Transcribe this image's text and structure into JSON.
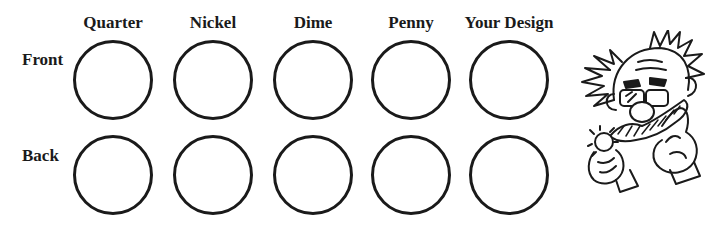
{
  "columns": [
    {
      "label": "Quarter",
      "x": 113
    },
    {
      "label": "Nickel",
      "x": 213
    },
    {
      "label": "Dime",
      "x": 313
    },
    {
      "label": "Penny",
      "x": 411
    },
    {
      "label": "Your Design",
      "x": 509
    }
  ],
  "rows": [
    {
      "label": "Front",
      "y": 40
    },
    {
      "label": "Back",
      "y": 135
    }
  ],
  "illustration": {
    "name": "cartoon-scientist-holding-coin-icon"
  }
}
